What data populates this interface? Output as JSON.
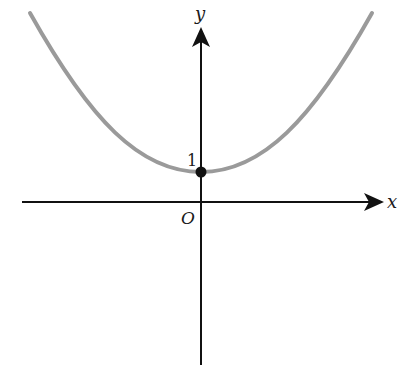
{
  "figure": {
    "x_axis_label": "x",
    "y_axis_label": "y",
    "origin_label": "O",
    "y_intercept_label": "1",
    "colors": {
      "axis": "#111111",
      "curve": "#9a9a9a",
      "point": "#111111",
      "background": "#ffffff"
    },
    "point": {
      "x": 0,
      "y": 1,
      "filled": true
    }
  }
}
